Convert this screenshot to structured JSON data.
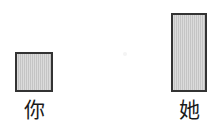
{
  "chart_data": {
    "type": "bar",
    "title": "",
    "subtitle": "",
    "xlabel": "",
    "ylabel": "",
    "categories": [
      "你",
      "她"
    ],
    "values": [
      40,
      79
    ],
    "ylim": [
      0,
      85
    ],
    "grid": false,
    "legend": false,
    "legend_position": "none",
    "annotations": [],
    "tick_labels": {
      "x": [
        "你",
        "她"
      ],
      "y": []
    },
    "style": {
      "background": "#ffffff",
      "bar_fill": "#cbcbcb",
      "bar_border": "#333333",
      "label_color": "#1a1a1a"
    },
    "bars": [
      {
        "category": "你",
        "value": 40
      },
      {
        "category": "她",
        "value": 79
      }
    ]
  }
}
